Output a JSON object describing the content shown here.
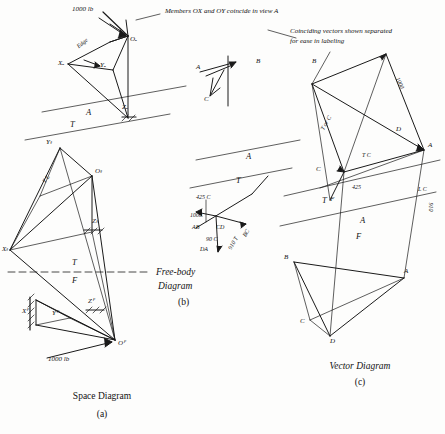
{
  "figure": {
    "title_a": "Space Diagram",
    "caption_a": "(a)",
    "title_b_line1": "Free-body",
    "title_b_line2": "Diagram",
    "caption_b": "(b)",
    "title_c": "Vector Diagram",
    "caption_c": "(c)",
    "note_top": "Members OX and OY coincide in view A",
    "note_right_line1": "Coinciding vectors shown separated",
    "note_right_line2": "for ease in labeling"
  },
  "space_diagram": {
    "load_top": "1000 lb",
    "load_bottom": "1000 lb",
    "edge_label": "Edge",
    "view_letters": [
      "A",
      "T",
      "F"
    ],
    "points": [
      {
        "id": "O-sub-A",
        "text": "Oₐ"
      },
      {
        "id": "Y-sub-A",
        "text": "Yₐ"
      },
      {
        "id": "X-sub-A",
        "text": "Xₐ"
      },
      {
        "id": "Z-sub-A",
        "text": "Zₐ"
      },
      {
        "id": "O-sub-T",
        "text": "Oₜ"
      },
      {
        "id": "Y-sub-T",
        "text": "Yₜ"
      },
      {
        "id": "X-sub-T",
        "text": "Xₜ"
      },
      {
        "id": "Z-sub-T",
        "text": "Zₜ"
      },
      {
        "id": "O-sub-F",
        "text": "Oꟳ"
      },
      {
        "id": "Y-sub-F",
        "text": "Yꟳ"
      },
      {
        "id": "X-sub-F",
        "text": "Xꟳ"
      },
      {
        "id": "Z-sub-F",
        "text": "Zꟳ"
      },
      {
        "id": "T-L",
        "text": "T L"
      }
    ]
  },
  "free_body": {
    "labels": [
      "A",
      "B",
      "C",
      "A",
      "T"
    ],
    "force_425": "425 C",
    "force_1000": "1000",
    "force_ab": "AB",
    "force_cd": "CD",
    "force_da": "DA",
    "force_bc": "BC",
    "force_910": "910 T",
    "force_90": "90 C"
  },
  "vector_diagram": {
    "labels_top": [
      "B",
      "A",
      "C",
      "D",
      "F",
      "T",
      "A",
      "B",
      "C",
      "D",
      "A"
    ],
    "mag_1000": "1000",
    "mag_910": "910",
    "mag_425": "425",
    "mag_t_or_c": "T or C",
    "mag_tc": "T C",
    "mag_lc": "L C",
    "view_letters": [
      "T",
      "A",
      "F"
    ]
  },
  "colors": {
    "ink": "#1a1a1a",
    "paper": "#fdfdfc"
  }
}
